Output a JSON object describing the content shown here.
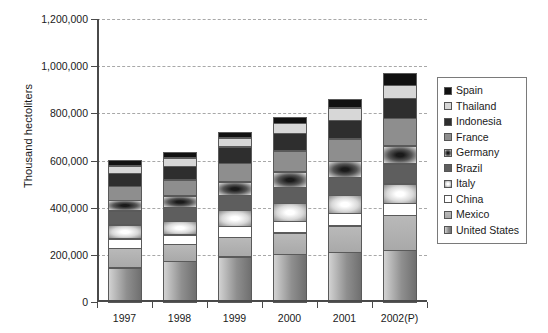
{
  "chart_data": {
    "type": "bar",
    "subtype": "stacked-bar",
    "title": "",
    "xlabel": "",
    "ylabel": "Thousand hectoliters",
    "categories": [
      "1997",
      "1998",
      "1999",
      "2000",
      "2001",
      "2002(P)"
    ],
    "ylim": [
      0,
      1200000
    ],
    "ytick_labels": [
      "0",
      "200,000",
      "400,000",
      "600,000",
      "800,000",
      "1,000,000",
      "1,200,000"
    ],
    "ytick_values": [
      0,
      200000,
      400000,
      600000,
      800000,
      1000000,
      1200000
    ],
    "grid": true,
    "grid_style": "dashed",
    "legend_position": "right",
    "stack_order_bottom_to_top": [
      "United States",
      "Mexico",
      "China",
      "Italy",
      "Brazil",
      "Germany",
      "France",
      "Indonesia",
      "Thailand",
      "Spain"
    ],
    "series": [
      {
        "name": "United States",
        "color": "#8f8f8f",
        "values": [
          148000,
          175000,
          195000,
          205000,
          215000,
          222000
        ]
      },
      {
        "name": "Mexico",
        "color": "#b2b2b2",
        "values": [
          85000,
          75000,
          85000,
          95000,
          115000,
          152000
        ]
      },
      {
        "name": "China",
        "color": "#ffffff",
        "values": [
          45000,
          45000,
          50000,
          52000,
          55000,
          55000
        ]
      },
      {
        "name": "Italy",
        "color": "#dcdcdc",
        "values": [
          62000,
          60000,
          70000,
          78000,
          80000,
          85000
        ]
      },
      {
        "name": "Brazil",
        "color": "#5e5e5e",
        "values": [
          62000,
          62000,
          68000,
          72000,
          78000,
          88000
        ]
      },
      {
        "name": "Germany",
        "color": "#3b3b3b",
        "values": [
          48000,
          52000,
          60000,
          68000,
          72000,
          78000
        ]
      },
      {
        "name": "France",
        "color": "#8e8e8e",
        "values": [
          62000,
          70000,
          82000,
          92000,
          98000,
          120000
        ]
      },
      {
        "name": "Indonesia",
        "color": "#2e2e2e",
        "values": [
          58000,
          62000,
          72000,
          78000,
          82000,
          88000
        ]
      },
      {
        "name": "Thailand",
        "color": "#d7d7d7",
        "values": [
          35000,
          38000,
          42000,
          45000,
          55000,
          58000
        ]
      },
      {
        "name": "Spain",
        "color": "#111111",
        "values": [
          25000,
          26000,
          28000,
          30000,
          40000,
          54000
        ]
      }
    ],
    "totals": [
      630000,
      665000,
      752000,
      815000,
      890000,
      1000000
    ]
  },
  "legend": {
    "items": [
      {
        "label": "Spain",
        "swatch": "swatch-spain"
      },
      {
        "label": "Thailand",
        "swatch": "swatch-thailand"
      },
      {
        "label": "Indonesia",
        "swatch": "swatch-indonesia"
      },
      {
        "label": "France",
        "swatch": "swatch-france"
      },
      {
        "label": "Germany",
        "swatch": "swatch-germany"
      },
      {
        "label": "Brazil",
        "swatch": "swatch-brazil"
      },
      {
        "label": "Italy",
        "swatch": "swatch-italy"
      },
      {
        "label": "China",
        "swatch": "swatch-china"
      },
      {
        "label": "Mexico",
        "swatch": "swatch-mexico"
      },
      {
        "label": "United States",
        "swatch": "swatch-united-states"
      }
    ]
  }
}
